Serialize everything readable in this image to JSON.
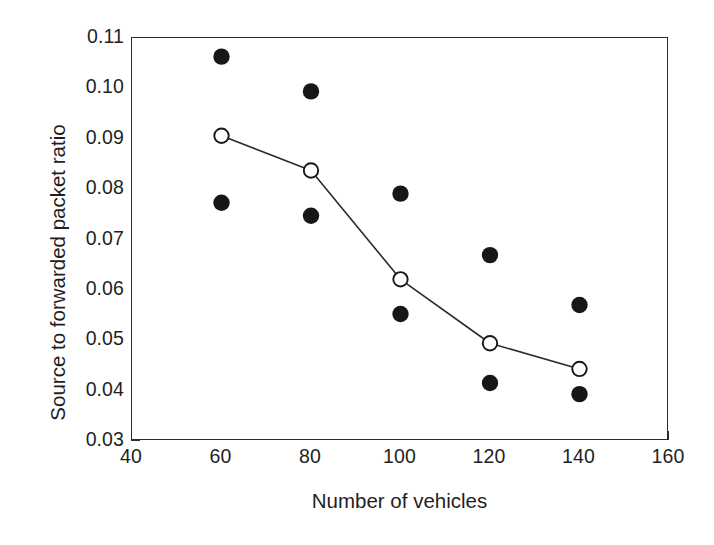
{
  "chart_data": {
    "type": "scatter",
    "title": "",
    "xlabel": "Number of vehicles",
    "ylabel": "Source to forwarded packet ratio",
    "xlim": [
      40,
      160
    ],
    "ylim": [
      0.03,
      0.11
    ],
    "xticks": [
      "40",
      "60",
      "80",
      "100",
      "120",
      "140",
      "160"
    ],
    "xtick_values": [
      40,
      60,
      80,
      100,
      120,
      140,
      160
    ],
    "yticks": [
      "0.03",
      "0.04",
      "0.05",
      "0.06",
      "0.07",
      "0.08",
      "0.09",
      "0.10",
      "0.11"
    ],
    "ytick_values": [
      0.03,
      0.04,
      0.05,
      0.06,
      0.07,
      0.08,
      0.09,
      0.1,
      0.11
    ],
    "grid": false,
    "legend": "none",
    "x": [
      60,
      80,
      100,
      120,
      140
    ],
    "series": [
      {
        "name": "upper filled markers",
        "marker": "filled-circle",
        "line": false,
        "values": [
          0.1063,
          0.0994,
          0.0791,
          0.0669,
          0.057
        ]
      },
      {
        "name": "mean open markers with line",
        "marker": "open-circle",
        "line": true,
        "values": [
          0.0906,
          0.0837,
          0.0621,
          0.0494,
          0.0443
        ]
      },
      {
        "name": "lower filled markers",
        "marker": "filled-circle",
        "line": false,
        "values": [
          0.0773,
          0.0747,
          0.0552,
          0.0415,
          0.0393
        ]
      }
    ],
    "colors": {
      "axis": "#2b2b2b",
      "marker_filled": "#171717",
      "marker_open_stroke": "#171717",
      "marker_open_fill": "#ffffff",
      "line": "#2b2b2b",
      "background": "#ffffff",
      "text": "#1f1f1f"
    }
  }
}
